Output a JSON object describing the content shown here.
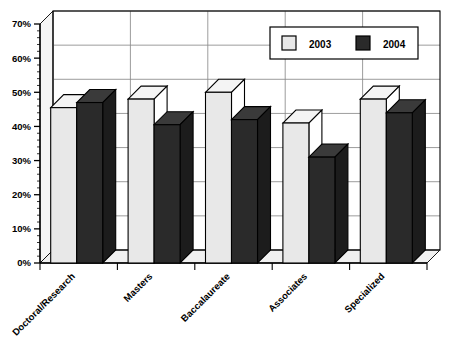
{
  "chart_data": {
    "type": "bar",
    "title": "",
    "subtitle": "",
    "xlabel": "",
    "ylabel": "",
    "categories": [
      "Doctoral/Research",
      "Masters",
      "Baccalaureate",
      "Associates",
      "Specialized"
    ],
    "series": [
      {
        "name": "2003",
        "values": [
          45.5,
          48.0,
          50.0,
          41.0,
          48.0
        ],
        "color": "#e8e8e8"
      },
      {
        "name": "2004",
        "values": [
          47.0,
          40.5,
          42.0,
          31.0,
          44.0
        ],
        "color": "#2a2a2a"
      }
    ],
    "ylim": [
      0,
      70
    ],
    "ytick_values": [
      0,
      10,
      20,
      30,
      40,
      50,
      60,
      70
    ],
    "ytick_labels": [
      "0%",
      "10%",
      "20%",
      "30%",
      "40%",
      "50%",
      "60%",
      "70%"
    ],
    "grid": true,
    "grid_axis": "y",
    "legend_position": "top-right",
    "style": "3d-column",
    "label_rotation": -45
  },
  "legend": {
    "entries": [
      {
        "label": "2003",
        "swatch": "light"
      },
      {
        "label": "2004",
        "swatch": "dark"
      }
    ]
  },
  "colors": {
    "series_2003": "#e8e8e8",
    "series_2004": "#2a2a2a",
    "series_2003_top": "#f4f4f4",
    "series_2003_side": "#ffffff",
    "series_2004_top": "#3a3a3a",
    "series_2004_side": "#1c1c1c",
    "plot_floor": "#f0f0f0",
    "plot_wall": "#ffffff",
    "grid": "#8a8a8a",
    "axis": "#000000",
    "background": "#ffffff"
  }
}
